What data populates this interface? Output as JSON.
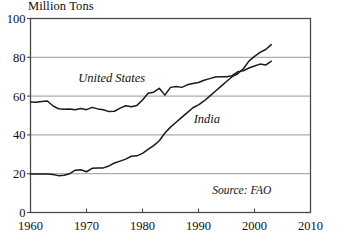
{
  "chart_data": {
    "type": "line",
    "title": "",
    "ylabel": "Million Tons",
    "xlabel": "",
    "xlim": [
      1960,
      2010
    ],
    "ylim": [
      0,
      100
    ],
    "grid": true,
    "legend_position": "inline-annotations",
    "yticks": [
      "0",
      "20",
      "40",
      "60",
      "80",
      "100"
    ],
    "ytick_values": [
      0,
      20,
      40,
      60,
      80,
      100
    ],
    "xticks": [
      "1960",
      "1970",
      "1980",
      "1990",
      "2000",
      "2010"
    ],
    "xtick_values": [
      1960,
      1970,
      1980,
      1990,
      2000,
      2010
    ],
    "annotations": [
      {
        "text": "United States",
        "x": 1974.5,
        "y": 67.5
      },
      {
        "text": "India",
        "x": 1991.5,
        "y": 46.0
      },
      {
        "text": "Source: FAO",
        "x": 2003.0,
        "y": 9.5
      }
    ],
    "source": "Source: FAO",
    "series": [
      {
        "name": "United States",
        "label": "United States",
        "x": [
          1960,
          1961,
          1962,
          1963,
          1964,
          1965,
          1966,
          1967,
          1968,
          1969,
          1970,
          1971,
          1972,
          1973,
          1974,
          1975,
          1976,
          1977,
          1978,
          1979,
          1980,
          1981,
          1982,
          1983,
          1984,
          1985,
          1986,
          1987,
          1988,
          1989,
          1990,
          1991,
          1992,
          1993,
          1994,
          1995,
          1996,
          1997,
          1998,
          1999,
          2000,
          2001,
          2002,
          2003
        ],
        "values": [
          57.0,
          56.8,
          57.2,
          57.5,
          55.0,
          53.5,
          53.2,
          53.4,
          53.0,
          53.6,
          53.0,
          54.2,
          53.4,
          53.0,
          52.0,
          52.2,
          53.8,
          55.0,
          54.5,
          55.2,
          58.0,
          61.5,
          62.0,
          64.0,
          60.5,
          64.5,
          65.0,
          64.5,
          65.8,
          66.5,
          67.0,
          68.2,
          69.0,
          69.8,
          70.0,
          70.0,
          70.5,
          72.5,
          73.0,
          74.5,
          75.5,
          76.5,
          76.0,
          78.0
        ]
      },
      {
        "name": "India",
        "label": "India",
        "x": [
          1960,
          1961,
          1962,
          1963,
          1964,
          1965,
          1966,
          1967,
          1968,
          1969,
          1970,
          1971,
          1972,
          1973,
          1974,
          1975,
          1976,
          1977,
          1978,
          1979,
          1980,
          1981,
          1982,
          1983,
          1984,
          1985,
          1986,
          1987,
          1988,
          1989,
          1990,
          1991,
          1992,
          1993,
          1994,
          1995,
          1996,
          1997,
          1998,
          1999,
          2000,
          2001,
          2002,
          2003
        ],
        "values": [
          19.8,
          19.9,
          19.9,
          19.8,
          19.6,
          19.0,
          19.2,
          20.0,
          21.8,
          22.0,
          21.0,
          22.8,
          23.0,
          23.0,
          24.0,
          25.5,
          26.5,
          27.5,
          29.0,
          29.2,
          30.5,
          32.5,
          34.5,
          37.0,
          41.0,
          44.0,
          46.5,
          49.0,
          51.5,
          54.0,
          55.5,
          57.5,
          60.0,
          62.5,
          65.0,
          67.5,
          70.0,
          71.5,
          74.0,
          78.0,
          80.5,
          82.5,
          84.0,
          86.5
        ]
      }
    ]
  }
}
